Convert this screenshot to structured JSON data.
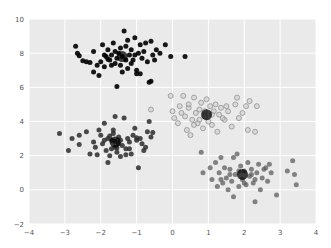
{
  "chart_data": {
    "type": "scatter",
    "title": "",
    "xlabel": "",
    "ylabel": "",
    "xlim": [
      -4,
      4
    ],
    "ylim": [
      -2,
      10
    ],
    "xticks": [
      -4,
      -3,
      -2,
      -1,
      0,
      1,
      2,
      3,
      4
    ],
    "yticks": [
      -2,
      0,
      2,
      4,
      6,
      8,
      10
    ],
    "grid": true,
    "legend": null,
    "background": "#eaeaea",
    "series": [
      {
        "name": "cluster 0",
        "color": "#000000",
        "alpha": 0.9,
        "points": [
          [
            -2.7,
            8.4
          ],
          [
            -2.65,
            8.0
          ],
          [
            -2.6,
            7.85
          ],
          [
            -2.4,
            7.5
          ],
          [
            -2.3,
            7.45
          ],
          [
            -2.2,
            8.1
          ],
          [
            -2.1,
            7.3
          ],
          [
            -2.05,
            6.7
          ],
          [
            -2.0,
            7.5
          ],
          [
            -1.95,
            8.5
          ],
          [
            -1.9,
            7.2
          ],
          [
            -1.85,
            7.8
          ],
          [
            -1.8,
            8.2
          ],
          [
            -1.75,
            7.6
          ],
          [
            -1.7,
            7.9
          ],
          [
            -1.65,
            8.6
          ],
          [
            -1.6,
            7.4
          ],
          [
            -1.55,
            7.7
          ],
          [
            -1.5,
            8.0
          ],
          [
            -1.45,
            7.3
          ],
          [
            -1.4,
            7.8
          ],
          [
            -1.35,
            9.3
          ],
          [
            -1.3,
            8.4
          ],
          [
            -1.25,
            7.1
          ],
          [
            -1.2,
            7.9
          ],
          [
            -1.15,
            8.2
          ],
          [
            -1.1,
            7.6
          ],
          [
            -1.05,
            8.9
          ],
          [
            -1.0,
            7.0
          ],
          [
            -0.95,
            8.0
          ],
          [
            -0.9,
            8.5
          ],
          [
            -0.85,
            7.7
          ],
          [
            -0.8,
            8.1
          ],
          [
            -0.7,
            7.5
          ],
          [
            -0.65,
            6.3
          ],
          [
            -0.6,
            8.7
          ],
          [
            -0.55,
            7.9
          ],
          [
            -0.5,
            7.6
          ],
          [
            -0.45,
            8.2
          ],
          [
            -0.35,
            8.0
          ],
          [
            -0.2,
            8.5
          ],
          [
            -0.05,
            7.8
          ],
          [
            0.35,
            7.8
          ],
          [
            -1.55,
            6.05
          ],
          [
            -1.0,
            6.8
          ],
          [
            -0.6,
            6.35
          ],
          [
            -1.4,
            6.9
          ],
          [
            -2.2,
            6.9
          ],
          [
            -1.7,
            7.3
          ],
          [
            -1.3,
            7.6
          ],
          [
            -1.15,
            7.4
          ],
          [
            -1.6,
            8.1
          ],
          [
            -1.9,
            7.9
          ],
          [
            -2.5,
            7.55
          ],
          [
            -0.75,
            8.6
          ],
          [
            -1.25,
            8.75
          ],
          [
            -1.8,
            7.65
          ],
          [
            -1.45,
            8.3
          ],
          [
            -1.05,
            7.9
          ],
          [
            -0.9,
            6.8
          ]
        ]
      },
      {
        "name": "cluster 1",
        "color": "#2b2b2b",
        "alpha": 0.85,
        "points": [
          [
            -3.15,
            3.3
          ],
          [
            -2.9,
            2.3
          ],
          [
            -2.8,
            3.0
          ],
          [
            -2.6,
            3.2
          ],
          [
            -2.6,
            2.65
          ],
          [
            -2.4,
            3.4
          ],
          [
            -2.2,
            2.8
          ],
          [
            -2.15,
            2.5
          ],
          [
            -2.1,
            2.05
          ],
          [
            -2.0,
            3.2
          ],
          [
            -1.95,
            2.7
          ],
          [
            -1.9,
            3.9
          ],
          [
            -1.85,
            2.3
          ],
          [
            -1.8,
            1.6
          ],
          [
            -1.8,
            3.0
          ],
          [
            -1.75,
            2.0
          ],
          [
            -1.7,
            2.9
          ],
          [
            -1.65,
            3.5
          ],
          [
            -1.6,
            2.5
          ],
          [
            -1.6,
            4.3
          ],
          [
            -1.55,
            2.2
          ],
          [
            -1.5,
            3.1
          ],
          [
            -1.45,
            1.95
          ],
          [
            -1.4,
            2.6
          ],
          [
            -1.35,
            4.2
          ],
          [
            -1.3,
            2.4
          ],
          [
            -1.25,
            3.0
          ],
          [
            -1.2,
            2.8
          ],
          [
            -1.15,
            2.1
          ],
          [
            -1.1,
            3.2
          ],
          [
            -1.05,
            3.6
          ],
          [
            -1.0,
            2.9
          ],
          [
            -0.95,
            1.3
          ],
          [
            -0.9,
            3.0
          ],
          [
            -0.85,
            2.7
          ],
          [
            -0.8,
            2.3
          ],
          [
            -0.7,
            3.4
          ],
          [
            -0.65,
            4.0
          ],
          [
            -0.6,
            3.1
          ],
          [
            -0.55,
            3.35
          ],
          [
            -0.75,
            2.5
          ],
          [
            -1.5,
            2.7
          ],
          [
            -1.7,
            2.4
          ],
          [
            -1.9,
            2.9
          ],
          [
            -2.05,
            3.5
          ],
          [
            -1.65,
            3.3
          ],
          [
            -1.45,
            2.9
          ],
          [
            -1.3,
            2.05
          ],
          [
            -1.0,
            3.05
          ],
          [
            -1.6,
            2.85
          ],
          [
            -1.75,
            3.15
          ],
          [
            -1.55,
            2.45
          ],
          [
            -2.3,
            2.1
          ],
          [
            -1.2,
            2.4
          ]
        ]
      },
      {
        "name": "cluster 2",
        "color": "#9a9a9a",
        "alpha": 0.6,
        "hollow": true,
        "points": [
          [
            -0.6,
            4.7
          ],
          [
            -0.05,
            5.5
          ],
          [
            0.0,
            4.6
          ],
          [
            0.05,
            4.2
          ],
          [
            0.2,
            4.9
          ],
          [
            0.3,
            5.5
          ],
          [
            0.35,
            4.3
          ],
          [
            0.4,
            3.5
          ],
          [
            0.45,
            4.8
          ],
          [
            0.5,
            3.2
          ],
          [
            0.55,
            4.1
          ],
          [
            0.6,
            5.4
          ],
          [
            0.65,
            4.5
          ],
          [
            0.7,
            3.9
          ],
          [
            0.75,
            4.7
          ],
          [
            0.8,
            5.1
          ],
          [
            0.85,
            3.6
          ],
          [
            0.9,
            4.3
          ],
          [
            0.95,
            5.3
          ],
          [
            1.0,
            4.0
          ],
          [
            1.05,
            4.9
          ],
          [
            1.1,
            3.8
          ],
          [
            1.15,
            4.6
          ],
          [
            1.2,
            5.0
          ],
          [
            1.25,
            3.4
          ],
          [
            1.3,
            4.4
          ],
          [
            1.35,
            4.8
          ],
          [
            1.45,
            4.1
          ],
          [
            1.55,
            4.6
          ],
          [
            1.65,
            3.7
          ],
          [
            1.75,
            5.0
          ],
          [
            1.8,
            5.4
          ],
          [
            1.85,
            4.2
          ],
          [
            1.95,
            4.5
          ],
          [
            2.05,
            4.9
          ],
          [
            2.1,
            3.5
          ],
          [
            2.15,
            5.2
          ],
          [
            2.35,
            4.9
          ],
          [
            2.3,
            3.4
          ],
          [
            0.25,
            4.5
          ],
          [
            0.6,
            3.8
          ],
          [
            0.9,
            4.6
          ],
          [
            1.4,
            4.2
          ],
          [
            0.75,
            4.1
          ],
          [
            1.1,
            4.4
          ],
          [
            0.45,
            5.0
          ],
          [
            1.5,
            4.9
          ],
          [
            0.15,
            3.9
          ]
        ]
      },
      {
        "name": "cluster 3",
        "color": "#5e5e5e",
        "alpha": 0.75,
        "points": [
          [
            0.8,
            2.2
          ],
          [
            0.85,
            1.0
          ],
          [
            1.05,
            1.3
          ],
          [
            1.1,
            0.6
          ],
          [
            1.2,
            1.6
          ],
          [
            1.25,
            0.2
          ],
          [
            1.3,
            1.0
          ],
          [
            1.35,
            1.9
          ],
          [
            1.4,
            0.4
          ],
          [
            1.45,
            1.3
          ],
          [
            1.5,
            0.7
          ],
          [
            1.55,
            0.0
          ],
          [
            1.6,
            1.2
          ],
          [
            1.65,
            0.5
          ],
          [
            1.7,
            1.9
          ],
          [
            1.7,
            -0.4
          ],
          [
            1.75,
            0.9
          ],
          [
            1.8,
            2.1
          ],
          [
            1.85,
            0.2
          ],
          [
            1.9,
            1.4
          ],
          [
            1.95,
            0.6
          ],
          [
            2.0,
            1.1
          ],
          [
            2.05,
            0.3
          ],
          [
            2.1,
            1.6
          ],
          [
            2.15,
            0.8
          ],
          [
            2.2,
            1.2
          ],
          [
            2.25,
            0.4
          ],
          [
            2.3,
            -0.7
          ],
          [
            2.35,
            1.0
          ],
          [
            2.4,
            1.5
          ],
          [
            2.45,
            0.0
          ],
          [
            2.5,
            0.7
          ],
          [
            2.6,
            1.3
          ],
          [
            2.65,
            0.5
          ],
          [
            2.75,
            1.0
          ],
          [
            2.9,
            -0.3
          ],
          [
            3.2,
            1.1
          ],
          [
            3.35,
            1.7
          ],
          [
            3.4,
            0.9
          ],
          [
            3.45,
            0.3
          ],
          [
            2.2,
            0.9
          ],
          [
            1.6,
            0.9
          ],
          [
            2.0,
            0.4
          ],
          [
            1.85,
            1.1
          ],
          [
            2.55,
            1.2
          ],
          [
            1.35,
            0.6
          ],
          [
            2.7,
            1.5
          ],
          [
            2.3,
            0.6
          ]
        ]
      }
    ],
    "centers": {
      "color": "#000000",
      "points": [
        [
          -1.4,
          7.8
        ],
        [
          -1.6,
          2.8
        ],
        [
          0.95,
          4.4
        ],
        [
          1.95,
          0.9
        ]
      ]
    }
  }
}
